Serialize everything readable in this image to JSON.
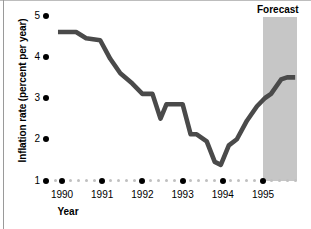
{
  "chart_data": {
    "type": "line",
    "title": "",
    "xlabel": "Year",
    "ylabel": "Inflation rate (percent per year)",
    "ylim": [
      1,
      5
    ],
    "xlim": [
      1989.75,
      1995.85
    ],
    "yticks": [
      1,
      2,
      3,
      4,
      5
    ],
    "ytick_labels": [
      "1",
      "2",
      "3",
      "4",
      "5"
    ],
    "xticks": [
      1990,
      1991,
      1992,
      1993,
      1994,
      1995
    ],
    "xtick_labels": [
      "1990",
      "1991",
      "1992",
      "1993",
      "1994",
      "1995"
    ],
    "grid": false,
    "legend": null,
    "line_color": "#4a4a4a",
    "line_width": 4.6,
    "series": [
      {
        "name": "Inflation rate",
        "x": [
          1989.9,
          1990.35,
          1990.6,
          1990.95,
          1991.2,
          1991.45,
          1991.75,
          1992.0,
          1992.25,
          1992.45,
          1992.6,
          1992.8,
          1993.0,
          1993.2,
          1993.35,
          1993.6,
          1993.8,
          1993.95,
          1994.15,
          1994.35,
          1994.6,
          1994.85,
          1995.05,
          1995.2,
          1995.45,
          1995.6,
          1995.8
        ],
        "y": [
          4.6,
          4.6,
          4.45,
          4.4,
          3.95,
          3.6,
          3.35,
          3.1,
          3.1,
          2.5,
          2.85,
          2.85,
          2.85,
          2.12,
          2.12,
          1.95,
          1.45,
          1.38,
          1.85,
          2.0,
          2.45,
          2.8,
          3.0,
          3.1,
          3.45,
          3.5,
          3.5
        ]
      }
    ],
    "annotations": [
      {
        "name": "forecast",
        "label": "Forecast",
        "x_start": 1995.0,
        "x_end": 1995.85,
        "shade_color": "#c6c6c6"
      }
    ]
  },
  "axis": {
    "y_title": "Inflation rate (percent per year)",
    "x_title": "Year"
  }
}
